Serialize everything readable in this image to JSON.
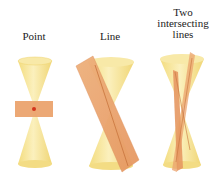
{
  "figure": {
    "panels": [
      {
        "id": "point",
        "label": "Point"
      },
      {
        "id": "line",
        "label": "Line"
      },
      {
        "id": "two-lines",
        "label_lines": [
          "Two",
          "intersecting",
          "lines"
        ]
      }
    ],
    "colors": {
      "cone_fill": "#f6e59a",
      "cone_edge": "#efd36c",
      "plane_fill": "#eba36e",
      "plane_edge": "#d9874f",
      "point_marker": "#d4341c"
    }
  }
}
